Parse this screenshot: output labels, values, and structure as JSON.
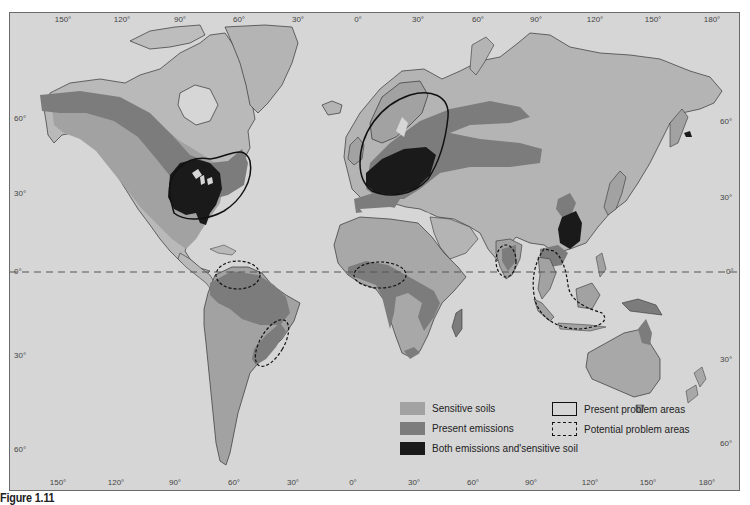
{
  "figure": {
    "caption": "Figure 1.11"
  },
  "map": {
    "type": "world map (Mercator-like)",
    "colors": {
      "ocean": "#d6d6d6",
      "land": "#b8b8b8",
      "sensitive_soils": "#a2a2a2",
      "present_emissions": "#7c7c7c",
      "both": "#1a1a1a",
      "outline": "#222222"
    },
    "top_longitude_labels": [
      "150°",
      "120°",
      "90°",
      "60°",
      "30°",
      "0°",
      "30°",
      "60°",
      "90°",
      "120°",
      "150°",
      "180°"
    ],
    "bottom_longitude_labels": [
      "150°",
      "120°",
      "90°",
      "60°",
      "30°",
      "0°",
      "30°",
      "60°",
      "90°",
      "120°",
      "150°",
      "180°"
    ],
    "left_latitude_labels": [
      "60°",
      "30°",
      "0°",
      "30°",
      "60°"
    ],
    "right_latitude_labels": [
      "60°",
      "30°",
      "0°",
      "30°",
      "60°"
    ],
    "equator_label": "0°"
  },
  "legend": {
    "items": [
      {
        "label": "Sensitive soils",
        "type": "fill",
        "color": "#a2a2a2"
      },
      {
        "label": "Present emissions",
        "type": "fill",
        "color": "#7c7c7c"
      },
      {
        "label": "Both emissions and'sensitive soil",
        "type": "fill",
        "color": "#1a1a1a"
      },
      {
        "label": "Present problem areas",
        "type": "solid-outline"
      },
      {
        "label": "Potential problem areas",
        "type": "dashed-outline"
      }
    ]
  },
  "regions": {
    "present_problem_areas": [
      "Eastern North America",
      "Northern/Central Europe"
    ],
    "potential_problem_areas": [
      "Northern South America (Venezuela)",
      "Southeastern Brazil",
      "West Africa (Gulf of Guinea)",
      "Southern India",
      "Southeast Asia (Thailand/Malaysia/Indonesia)"
    ],
    "both_emissions_and_sensitive": [
      "Eastern USA / Great Lakes",
      "Central Europe",
      "Southeastern China"
    ]
  }
}
